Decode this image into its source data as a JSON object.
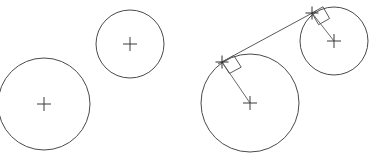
{
  "figure": {
    "background_color": "#ffffff",
    "stroke_color": "#4a4a4a",
    "width": 370,
    "height": 157
  },
  "chart_data": {
    "type": "diagram",
    "xlabel": "",
    "ylabel": "",
    "xlim": [
      0,
      370
    ],
    "ylim": [
      0,
      157
    ],
    "grid": false,
    "legend": "none",
    "panels": [
      {
        "name": "left-panel",
        "label": "Two circles without tangent construction",
        "has_tangent_line": false,
        "circles": [
          {
            "id": "left-large-circle",
            "center": [
              44,
              104
            ],
            "radius": 46,
            "center_marker": "plus",
            "clipped_edges": [
              "left",
              "bottom"
            ]
          },
          {
            "id": "left-small-circle",
            "center": [
              130,
              44
            ],
            "radius": 34,
            "center_marker": "plus",
            "clipped_edges": []
          }
        ]
      },
      {
        "name": "right-panel",
        "label": "Two circles with common external tangent",
        "has_tangent_line": true,
        "circles": [
          {
            "id": "right-large-circle",
            "center": [
              250,
              103
            ],
            "radius": 49,
            "center_marker": "plus",
            "clipped_edges": [
              "bottom"
            ]
          },
          {
            "id": "right-small-circle",
            "center": [
              334,
              41
            ],
            "radius": 34,
            "center_marker": "plus",
            "clipped_edges": []
          }
        ],
        "tangent_line": {
          "id": "common-external-tangent",
          "from": [
            222,
            62
          ],
          "to": [
            312,
            13
          ],
          "extended_from": [
            218,
            64
          ],
          "extended_to": [
            316,
            11
          ]
        },
        "radii": [
          {
            "id": "radius-to-large-tangent-point",
            "from": [
              250,
              103
            ],
            "to": [
              222,
              62
            ]
          },
          {
            "id": "radius-to-small-tangent-point",
            "from": [
              334,
              41
            ],
            "to": [
              312,
              13
            ]
          }
        ],
        "tangent_points": [
          {
            "id": "tangent-point-large",
            "position": [
              222,
              62
            ],
            "marker": "plus",
            "right_angle_marker": true
          },
          {
            "id": "tangent-point-small",
            "position": [
              312,
              13
            ],
            "marker": "plus",
            "right_angle_marker": true
          }
        ],
        "right_angle_markers": [
          {
            "id": "right-angle-large",
            "vertex": [
              222,
              62
            ],
            "size": 14,
            "note": "square indicating tangent line is perpendicular to radius"
          },
          {
            "id": "right-angle-small",
            "vertex": [
              312,
              13
            ],
            "size": 13,
            "note": "square indicating tangent line is perpendicular to radius"
          }
        ]
      }
    ]
  }
}
